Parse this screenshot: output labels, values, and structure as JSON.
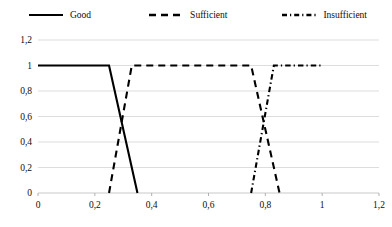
{
  "chart_data": {
    "type": "line",
    "title": "",
    "xlabel": "",
    "ylabel": "",
    "xlim": [
      0,
      1.2
    ],
    "ylim": [
      0,
      1.2
    ],
    "grid": true,
    "legend_position": "top",
    "x_ticks": [
      "0",
      "0,2",
      "0,4",
      "0,6",
      "0,8",
      "1",
      "1,2"
    ],
    "x_tick_values": [
      0,
      0.2,
      0.4,
      0.6,
      0.8,
      1.0,
      1.2
    ],
    "y_ticks": [
      "0",
      "0,2",
      "0,4",
      "0,6",
      "0,8",
      "1",
      "1,2"
    ],
    "y_tick_values": [
      0,
      0.2,
      0.4,
      0.6,
      0.8,
      1.0,
      1.2
    ],
    "series": [
      {
        "name": "Good",
        "style": "solid",
        "color": "#000000",
        "points": [
          [
            0.0,
            1.0
          ],
          [
            0.25,
            1.0
          ],
          [
            0.35,
            0.0
          ]
        ]
      },
      {
        "name": "Sufficient",
        "style": "dashed",
        "color": "#000000",
        "points": [
          [
            0.25,
            0.0
          ],
          [
            0.33,
            1.0
          ],
          [
            0.75,
            1.0
          ],
          [
            0.85,
            0.0
          ]
        ]
      },
      {
        "name": "Insufficient",
        "style": "dash-dot",
        "color": "#000000",
        "points": [
          [
            0.75,
            0.0
          ],
          [
            0.83,
            1.0
          ],
          [
            1.0,
            1.0
          ]
        ]
      }
    ]
  },
  "legend": {
    "items": [
      {
        "label": "Good",
        "style": "solid"
      },
      {
        "label": "Sufficient",
        "style": "dashed"
      },
      {
        "label": "Insufficient",
        "style": "dash-dot"
      }
    ]
  },
  "axes": {
    "y_labels": [
      "1,2",
      "1",
      "0,8",
      "0,6",
      "0,4",
      "0,2",
      "0"
    ],
    "x_labels": [
      "0",
      "0,2",
      "0,4",
      "0,6",
      "0,8",
      "1",
      "1,2"
    ]
  }
}
